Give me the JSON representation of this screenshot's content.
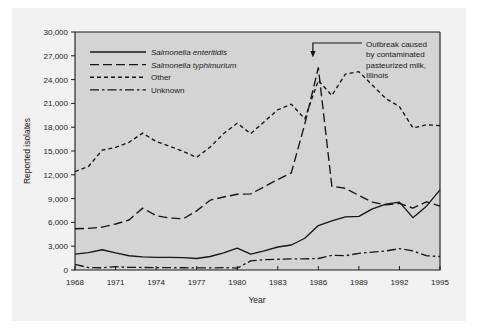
{
  "chart_data": {
    "type": "line",
    "title": "",
    "xlabel": "Year",
    "ylabel": "Reported isolates",
    "xlim": [
      1968,
      1995
    ],
    "ylim": [
      0,
      30000
    ],
    "ytick_step": 3000,
    "xtick_step": 3,
    "grid": false,
    "legend_position": "upper-left-inside",
    "x": [
      1968,
      1969,
      1970,
      1971,
      1972,
      1973,
      1974,
      1975,
      1976,
      1977,
      1978,
      1979,
      1980,
      1981,
      1982,
      1983,
      1984,
      1985,
      1986,
      1987,
      1988,
      1989,
      1990,
      1991,
      1992,
      1993,
      1994,
      1995
    ],
    "xtick_labels": [
      "1968",
      "1971",
      "1974",
      "1977",
      "1980",
      "1983",
      "1986",
      "1989",
      "1992",
      "1995"
    ],
    "ytick_labels": [
      "0",
      "3,000",
      "6,000",
      "9,000",
      "12,000",
      "15,000",
      "18,000",
      "21,000",
      "24,000",
      "27,000",
      "30,000"
    ],
    "series": [
      {
        "name": "Salmonella enteritidis",
        "style": "solid",
        "italic": true,
        "values": [
          2000,
          2200,
          2550,
          2150,
          1800,
          1650,
          1600,
          1600,
          1550,
          1450,
          1700,
          2150,
          2750,
          2000,
          2400,
          2900,
          3150,
          4000,
          5600,
          6200,
          6700,
          6750,
          7700,
          8300,
          8550,
          6600,
          8050,
          10100
        ]
      },
      {
        "name": "Salmonella typhimurium",
        "style": "long-dash",
        "italic": true,
        "values": [
          5200,
          5250,
          5400,
          5800,
          6300,
          7800,
          6850,
          6550,
          6450,
          7450,
          8800,
          9200,
          9550,
          9600,
          10500,
          11400,
          12250,
          18400,
          25500,
          10550,
          10300,
          9400,
          8550,
          8200,
          8400,
          7800,
          8600,
          8050
        ]
      },
      {
        "name": "Other",
        "style": "short-dash",
        "italic": false,
        "values": [
          12400,
          13050,
          15100,
          15450,
          16100,
          17250,
          16200,
          15600,
          14950,
          14200,
          15500,
          17200,
          18500,
          17200,
          18700,
          20200,
          20900,
          19050,
          23900,
          22000,
          24700,
          25000,
          23300,
          21600,
          20600,
          17900,
          18300,
          18200
        ]
      },
      {
        "name": "Unknown",
        "style": "dash-dot",
        "italic": false,
        "values": [
          700,
          300,
          280,
          420,
          330,
          320,
          290,
          300,
          280,
          270,
          260,
          300,
          240,
          1150,
          1300,
          1350,
          1400,
          1400,
          1450,
          1850,
          1800,
          2100,
          2250,
          2400,
          2700,
          2400,
          1800,
          1700
        ]
      }
    ],
    "annotations": [
      {
        "text_lines": [
          "Outbreak caused",
          "by contaminated",
          "pasteurized milk,",
          "Illinois"
        ],
        "points_to_year": 1985.6,
        "points_to_value": 26800
      }
    ],
    "colors": {
      "line": "#161616",
      "axis": "#1a1a1a",
      "figure_background": "#f2f2f2",
      "plot_background": "#d4d4d4",
      "page_background": "#ffffff"
    }
  }
}
